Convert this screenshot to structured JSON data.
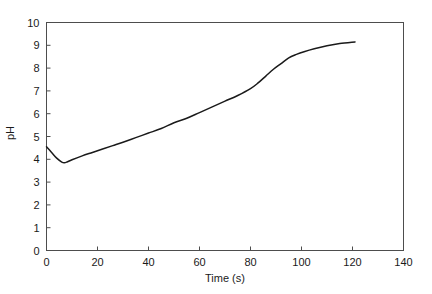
{
  "chart_data": {
    "type": "line",
    "title": "",
    "xlabel": "Time (s)",
    "ylabel": "pH",
    "xlim": [
      0,
      140
    ],
    "ylim": [
      0,
      10
    ],
    "xticks": [
      0,
      20,
      40,
      60,
      80,
      100,
      120,
      140
    ],
    "xtick_labels": [
      "0",
      "20",
      "40",
      "60",
      "80",
      "100",
      "120",
      "140"
    ],
    "yticks": [
      0,
      1,
      2,
      3,
      4,
      5,
      6,
      7,
      8,
      9,
      10
    ],
    "ytick_labels": [
      "0",
      "1",
      "2",
      "3",
      "4",
      "5",
      "6",
      "7",
      "8",
      "9",
      "10"
    ],
    "grid": false,
    "legend": false,
    "legend_position": "none",
    "series": [
      {
        "name": "pH",
        "color": "#1a1a1a",
        "x": [
          0,
          2,
          4,
          6,
          7,
          8,
          10,
          14,
          18,
          22,
          26,
          30,
          35,
          40,
          45,
          50,
          55,
          60,
          65,
          70,
          75,
          80,
          83,
          86,
          89,
          92,
          95,
          98,
          101,
          105,
          110,
          115,
          121
        ],
        "y": [
          4.55,
          4.3,
          4.05,
          3.88,
          3.85,
          3.88,
          3.98,
          4.15,
          4.3,
          4.45,
          4.6,
          4.75,
          4.95,
          5.15,
          5.35,
          5.6,
          5.8,
          6.05,
          6.3,
          6.55,
          6.8,
          7.1,
          7.35,
          7.65,
          7.95,
          8.2,
          8.45,
          8.6,
          8.72,
          8.85,
          8.98,
          9.08,
          9.15
        ]
      }
    ],
    "annotations": []
  },
  "axes": {
    "xlabel": "Time (s)",
    "ylabel": "pH"
  }
}
